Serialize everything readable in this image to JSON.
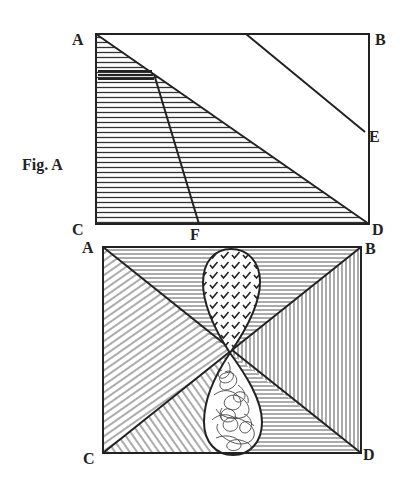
{
  "figure_a": {
    "caption": "Fig. A",
    "labels": {
      "a": "A",
      "b": "B",
      "c": "C",
      "d": "D",
      "e": "E",
      "f": "F"
    },
    "rect": {
      "x1": 96,
      "y1": 34,
      "x2": 369,
      "y2": 224
    },
    "lines": [
      {
        "name": "diagonal-A-D",
        "from": "A",
        "to": "D"
      },
      {
        "name": "line-to-E",
        "from": [
          246,
          34
        ],
        "to": [
          365,
          132
        ]
      },
      {
        "name": "line-to-F",
        "from": [
          154,
          73
        ],
        "to": [
          199,
          224
        ]
      }
    ],
    "hatching": "horizontal lines filling triangle A-C-D"
  },
  "figure_b": {
    "labels": {
      "a": "A",
      "b": "B",
      "c": "C",
      "d": "D"
    },
    "rect": {
      "x1": 103,
      "y1": 247,
      "x2": 361,
      "y2": 453
    },
    "center": [
      230,
      353
    ],
    "regions": [
      {
        "name": "top-triangle",
        "hatching": "horizontal"
      },
      {
        "name": "right-triangle",
        "hatching": "vertical"
      },
      {
        "name": "left-triangle",
        "hatching": "diagonal-up"
      },
      {
        "name": "bottom-triangle-left",
        "hatching": "diagonal-down"
      },
      {
        "name": "bottom-triangle-right",
        "hatching": "horizontal"
      }
    ],
    "shapes": [
      {
        "name": "upper-teardrop",
        "fill": "check-mark strokes"
      },
      {
        "name": "lower-teardrop",
        "fill": "scribbled loops"
      }
    ]
  },
  "colors": {
    "ink": "#222222",
    "hatch": "#333333",
    "background": "#ffffff"
  }
}
